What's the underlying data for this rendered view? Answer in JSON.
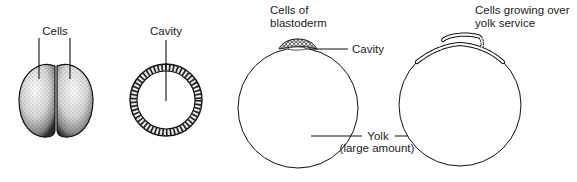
{
  "diagram": {
    "colors": {
      "line": "#111111",
      "text": "#222222",
      "background": "#ffffff"
    },
    "panels": [
      {
        "id": "two-cell",
        "labels": {
          "cells": "Cells"
        }
      },
      {
        "id": "blastula",
        "labels": {
          "cavity": "Cavity"
        }
      },
      {
        "id": "blastoderm-egg",
        "labels": {
          "cells_line1": "Cells of",
          "cells_line2": "blastoderm",
          "cavity": "Cavity"
        }
      },
      {
        "id": "growing-egg",
        "labels": {
          "cells_line1": "Cells growing over",
          "cells_line2": "yolk service"
        }
      }
    ],
    "shared": {
      "yolk": "Yolk",
      "yolk_note": "(large amount)"
    }
  }
}
